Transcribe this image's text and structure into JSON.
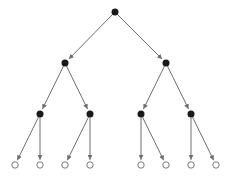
{
  "diagram": {
    "type": "binary-tree",
    "colors": {
      "edge": "#6e6e6e",
      "internal_node": "#1a1a1a",
      "leaf_stroke": "#7a7a7a",
      "leaf_fill": "#ffffff"
    },
    "nodes": [
      {
        "id": "n0",
        "x": 115,
        "y": 12,
        "kind": "internal"
      },
      {
        "id": "n1",
        "x": 65,
        "y": 63,
        "kind": "internal"
      },
      {
        "id": "n2",
        "x": 166,
        "y": 63,
        "kind": "internal"
      },
      {
        "id": "n3",
        "x": 40,
        "y": 114,
        "kind": "internal"
      },
      {
        "id": "n4",
        "x": 90,
        "y": 114,
        "kind": "internal"
      },
      {
        "id": "n5",
        "x": 141,
        "y": 114,
        "kind": "internal"
      },
      {
        "id": "n6",
        "x": 191,
        "y": 114,
        "kind": "internal"
      },
      {
        "id": "l0",
        "x": 15,
        "y": 165,
        "kind": "leaf"
      },
      {
        "id": "l1",
        "x": 40,
        "y": 165,
        "kind": "leaf"
      },
      {
        "id": "l2",
        "x": 65,
        "y": 165,
        "kind": "leaf"
      },
      {
        "id": "l3",
        "x": 90,
        "y": 165,
        "kind": "leaf"
      },
      {
        "id": "l4",
        "x": 141,
        "y": 165,
        "kind": "leaf"
      },
      {
        "id": "l5",
        "x": 166,
        "y": 165,
        "kind": "leaf"
      },
      {
        "id": "l6",
        "x": 191,
        "y": 165,
        "kind": "leaf"
      },
      {
        "id": "l7",
        "x": 216,
        "y": 165,
        "kind": "leaf"
      }
    ],
    "edges": [
      [
        "n0",
        "n1"
      ],
      [
        "n0",
        "n2"
      ],
      [
        "n1",
        "n3"
      ],
      [
        "n1",
        "n4"
      ],
      [
        "n2",
        "n5"
      ],
      [
        "n2",
        "n6"
      ],
      [
        "n3",
        "l0"
      ],
      [
        "n3",
        "l1"
      ],
      [
        "n4",
        "l2"
      ],
      [
        "n4",
        "l3"
      ],
      [
        "n5",
        "l4"
      ],
      [
        "n5",
        "l5"
      ],
      [
        "n6",
        "l6"
      ],
      [
        "n6",
        "l7"
      ]
    ]
  }
}
